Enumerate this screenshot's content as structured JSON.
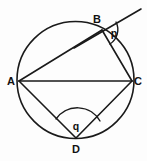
{
  "figure": {
    "background_color": "#fdfdfd",
    "stroke_color": "#1a1a1a",
    "width": 147,
    "height": 161
  },
  "circle": {
    "name": "circumscribed-circle",
    "center_x": 75.5,
    "center_y": 80,
    "radius": 58.5
  },
  "points": [
    {
      "id": "A",
      "label": "A",
      "x": 19,
      "y": 81,
      "label_x": 11,
      "label_y": 85
    },
    {
      "id": "B",
      "label": "B",
      "x": 102,
      "y": 30,
      "label_x": 97,
      "label_y": 23
    },
    {
      "id": "C",
      "label": "C",
      "x": 132,
      "y": 81,
      "label_x": 138,
      "label_y": 85
    },
    {
      "id": "D",
      "label": "D",
      "x": 76,
      "y": 138,
      "label_x": 76,
      "label_y": 153
    }
  ],
  "chords": [
    {
      "name": "chord-AB",
      "from": "A",
      "to": "B",
      "x1": 19,
      "y1": 81,
      "x2": 102,
      "y2": 30
    },
    {
      "name": "chord-BC",
      "from": "B",
      "to": "C",
      "x1": 102,
      "y1": 30,
      "x2": 132,
      "y2": 81
    },
    {
      "name": "chord-CD",
      "from": "C",
      "to": "D",
      "x1": 132,
      "y1": 81,
      "x2": 76,
      "y2": 138
    },
    {
      "name": "chord-DA",
      "from": "D",
      "to": "A",
      "x1": 76,
      "y1": 138,
      "x2": 19,
      "y2": 81
    },
    {
      "name": "chord-AC",
      "from": "A",
      "to": "C",
      "x1": 19,
      "y1": 81,
      "x2": 132,
      "y2": 81
    }
  ],
  "tangent": {
    "name": "tangent-line-at-B",
    "touch_point": "B",
    "x1": 74,
    "y1": 48,
    "x2": 141,
    "y2": 9
  },
  "angles": [
    {
      "id": "p",
      "label": "p",
      "vertex": "B",
      "description": "angle between tangent at B and chord BC",
      "arc_path": "M 116 22 A 17 17 0 0 1 110 44",
      "label_x": 114,
      "label_y": 37
    },
    {
      "id": "q",
      "label": "q",
      "vertex": "D",
      "description": "angle ADC subtended at D",
      "arc_path": "M 56 119 A 26 26 0 0 1 100 121",
      "label_x": 76,
      "label_y": 130
    }
  ]
}
